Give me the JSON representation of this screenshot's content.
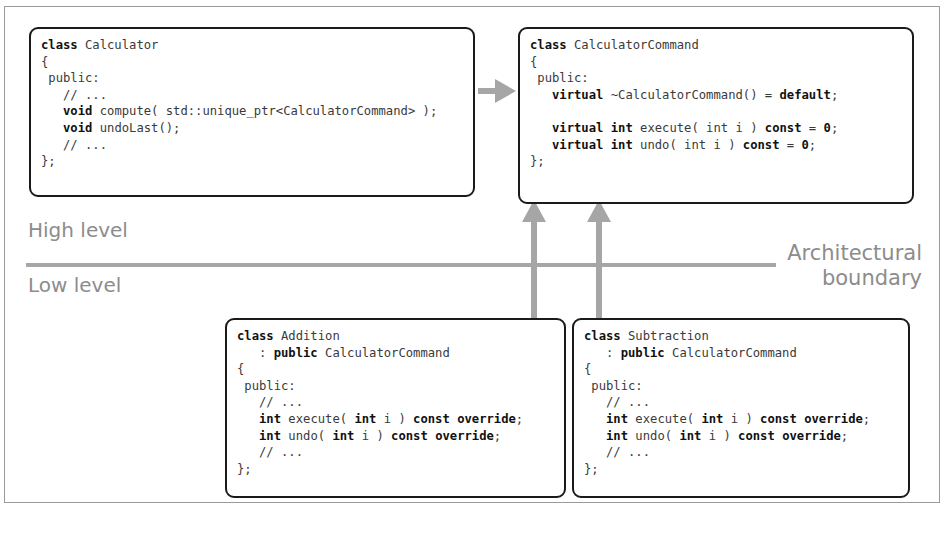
{
  "diagram": {
    "boxes": [
      {
        "id": "calculator",
        "lines": [
          [
            {
              "t": "class",
              "b": true
            },
            {
              "t": " Calculator"
            }
          ],
          [
            {
              "t": "{"
            }
          ],
          [
            {
              "t": " public:"
            }
          ],
          [
            {
              "t": "   // ..."
            }
          ],
          [
            {
              "t": "   "
            },
            {
              "t": "void",
              "b": true
            },
            {
              "t": " compute( std::unique_ptr<CalculatorCommand> );"
            }
          ],
          [
            {
              "t": "   "
            },
            {
              "t": "void",
              "b": true
            },
            {
              "t": " undoLast();"
            }
          ],
          [
            {
              "t": "   // ..."
            }
          ],
          [
            {
              "t": "};"
            }
          ]
        ]
      },
      {
        "id": "calculator-command",
        "lines": [
          [
            {
              "t": "class",
              "b": true
            },
            {
              "t": " CalculatorCommand"
            }
          ],
          [
            {
              "t": "{"
            }
          ],
          [
            {
              "t": " public:"
            }
          ],
          [
            {
              "t": "   "
            },
            {
              "t": "virtual",
              "b": true
            },
            {
              "t": " ~CalculatorCommand() = "
            },
            {
              "t": "default",
              "b": true
            },
            {
              "t": ";"
            }
          ],
          [
            {
              "t": ""
            }
          ],
          [
            {
              "t": "   "
            },
            {
              "t": "virtual",
              "b": true
            },
            {
              "t": " "
            },
            {
              "t": "int",
              "b": true
            },
            {
              "t": " execute( int i ) "
            },
            {
              "t": "const",
              "b": true
            },
            {
              "t": " = "
            },
            {
              "t": "0",
              "b": true
            },
            {
              "t": ";"
            }
          ],
          [
            {
              "t": "   "
            },
            {
              "t": "virtual",
              "b": true
            },
            {
              "t": " "
            },
            {
              "t": "int",
              "b": true
            },
            {
              "t": " undo( int i ) "
            },
            {
              "t": "const",
              "b": true
            },
            {
              "t": " = "
            },
            {
              "t": "0",
              "b": true
            },
            {
              "t": ";"
            }
          ],
          [
            {
              "t": "};"
            }
          ]
        ]
      },
      {
        "id": "addition",
        "lines": [
          [
            {
              "t": "class",
              "b": true
            },
            {
              "t": " Addition"
            }
          ],
          [
            {
              "t": "   : "
            },
            {
              "t": "public",
              "b": true
            },
            {
              "t": " CalculatorCommand"
            }
          ],
          [
            {
              "t": "{"
            }
          ],
          [
            {
              "t": " public:"
            }
          ],
          [
            {
              "t": "   // ..."
            }
          ],
          [
            {
              "t": "   "
            },
            {
              "t": "int",
              "b": true
            },
            {
              "t": " execute( "
            },
            {
              "t": "int",
              "b": true
            },
            {
              "t": " i ) "
            },
            {
              "t": "const override",
              "b": true
            },
            {
              "t": ";"
            }
          ],
          [
            {
              "t": "   "
            },
            {
              "t": "int",
              "b": true
            },
            {
              "t": " undo( "
            },
            {
              "t": "int",
              "b": true
            },
            {
              "t": " i ) "
            },
            {
              "t": "const override",
              "b": true
            },
            {
              "t": ";"
            }
          ],
          [
            {
              "t": "   // ..."
            }
          ],
          [
            {
              "t": "};"
            }
          ]
        ]
      },
      {
        "id": "subtraction",
        "lines": [
          [
            {
              "t": "class",
              "b": true
            },
            {
              "t": " Subtraction"
            }
          ],
          [
            {
              "t": "   : "
            },
            {
              "t": "public",
              "b": true
            },
            {
              "t": " CalculatorCommand"
            }
          ],
          [
            {
              "t": "{"
            }
          ],
          [
            {
              "t": " public:"
            }
          ],
          [
            {
              "t": "   // ..."
            }
          ],
          [
            {
              "t": "   "
            },
            {
              "t": "int",
              "b": true
            },
            {
              "t": " execute( "
            },
            {
              "t": "int",
              "b": true
            },
            {
              "t": " i ) "
            },
            {
              "t": "const override",
              "b": true
            },
            {
              "t": ";"
            }
          ],
          [
            {
              "t": "   "
            },
            {
              "t": "int",
              "b": true
            },
            {
              "t": " undo( "
            },
            {
              "t": "int",
              "b": true
            },
            {
              "t": " i ) "
            },
            {
              "t": "const override",
              "b": true
            },
            {
              "t": ";"
            }
          ],
          [
            {
              "t": "   // ..."
            }
          ],
          [
            {
              "t": "};"
            }
          ]
        ]
      }
    ],
    "labels": {
      "high_level": "High level",
      "low_level": "Low level",
      "boundary_line1": "Architectural",
      "boundary_line2": "boundary"
    },
    "colors": {
      "arrow": "#a6a6a6",
      "box_border": "#1a1a1a",
      "label": "#8c8c8c"
    }
  }
}
